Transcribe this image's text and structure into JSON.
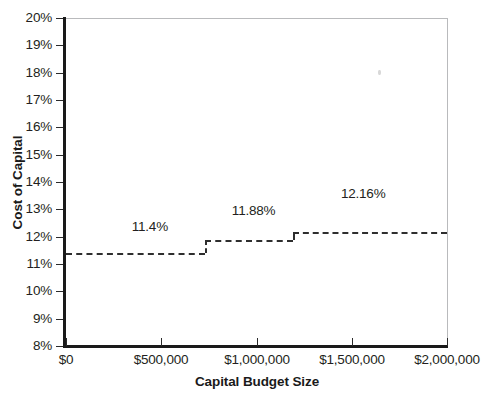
{
  "chart_data": {
    "type": "line",
    "subtype": "step",
    "title": "",
    "xlabel": "Capital Budget Size",
    "ylabel": "Cost of Capital",
    "xlim": [
      0,
      2000000
    ],
    "ylim": [
      0.08,
      0.2
    ],
    "grid": false,
    "legend": null,
    "xtick_labels": [
      "$0",
      "$500,000",
      "$1,000,000",
      "$1,500,000",
      "$2,000,000"
    ],
    "xtick_values": [
      0,
      500000,
      1000000,
      1500000,
      2000000
    ],
    "ytick_labels": [
      "8%",
      "9%",
      "10%",
      "11%",
      "12%",
      "13%",
      "14%",
      "15%",
      "16%",
      "17%",
      "18%",
      "19%",
      "20%"
    ],
    "ytick_values": [
      0.08,
      0.09,
      0.1,
      0.11,
      0.12,
      0.13,
      0.14,
      0.15,
      0.16,
      0.17,
      0.18,
      0.19,
      0.2
    ],
    "series": [
      {
        "name": "Marginal Cost of Capital",
        "style": "dashed-step",
        "color": "#2e2e2e",
        "steps": [
          {
            "label": "11.4%",
            "value": 0.114,
            "x_start": 0,
            "x_end": 730000
          },
          {
            "label": "11.88%",
            "value": 0.1188,
            "x_start": 730000,
            "x_end": 1190000
          },
          {
            "label": "12.16%",
            "value": 0.1216,
            "x_start": 1190000,
            "x_end": 2000000
          }
        ]
      }
    ],
    "annotations": [
      {
        "text": "11.4%",
        "x": 440000,
        "y": 0.1235
      },
      {
        "text": "11.88%",
        "x": 985000,
        "y": 0.1295
      },
      {
        "text": "12.16%",
        "x": 1560000,
        "y": 0.1355
      }
    ]
  }
}
